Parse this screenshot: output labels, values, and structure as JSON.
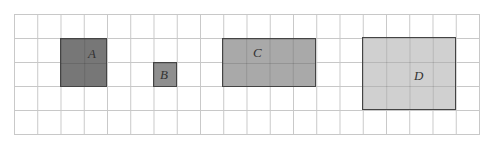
{
  "grid": {
    "columns": 20,
    "rows": 5
  },
  "shapes": [
    {
      "label": "A",
      "col": 2,
      "row": 1,
      "width": 2,
      "height": 2,
      "color": "#777777"
    },
    {
      "label": "B",
      "col": 6,
      "row": 2,
      "width": 1,
      "height": 1,
      "color": "#8f8f8f"
    },
    {
      "label": "C",
      "col": 9,
      "row": 1,
      "width": 4,
      "height": 2,
      "color": "#a9a9a9"
    },
    {
      "label": "D",
      "col": 15,
      "row": 1,
      "width": 4,
      "height": 3,
      "color": "#d0d0d0"
    }
  ]
}
